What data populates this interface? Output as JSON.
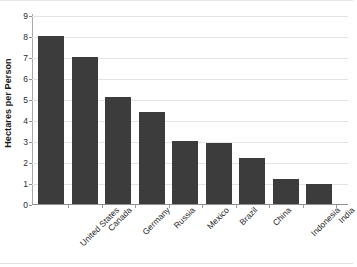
{
  "chart": {
    "title": "",
    "y_axis_title": "Hectares per Person"
  },
  "chart_data": {
    "type": "bar",
    "title": "",
    "subtitle": "",
    "xlabel": "",
    "ylabel": "Hectares per Person",
    "ylim": [
      0,
      9
    ],
    "y_ticks": [
      0,
      1,
      2,
      3,
      4,
      5,
      6,
      7,
      8,
      9
    ],
    "grid": true,
    "legend": false,
    "legend_position": "none",
    "bar_color": "#3c3c3c",
    "gridline_color": "#e4e4e4",
    "axis_color": "#8f8f8f",
    "background_color": "#ffffff",
    "categories": [
      "United States",
      "Canada",
      "Germany",
      "Russia",
      "Mexico",
      "Brazil",
      "China",
      "Indonesia",
      "India"
    ],
    "values": [
      8.0,
      7.0,
      5.1,
      4.4,
      3.0,
      2.9,
      2.2,
      1.2,
      0.95
    ]
  }
}
